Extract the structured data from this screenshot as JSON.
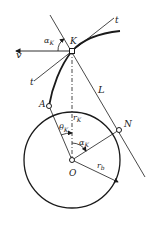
{
  "diagram": {
    "colors": {
      "line": "#1a1a1a",
      "background": "#ffffff"
    },
    "labels": {
      "v": "v",
      "alpha_K_top": "α",
      "alpha_K_top_sub": "K",
      "K": "K",
      "t_top": "t",
      "t_left": "t",
      "L": "L",
      "A": "A",
      "r_K": "r",
      "r_K_sub": "K",
      "N": "N",
      "theta_K": "θ",
      "theta_K_sub": "K",
      "alpha_K_bottom": "α",
      "alpha_K_bottom_sub": "K",
      "O": "O",
      "r_b": "r",
      "r_b_sub": "b"
    },
    "points": {
      "K": [
        72,
        51
      ],
      "O": [
        72,
        160
      ],
      "A": [
        49,
        106
      ],
      "N": [
        119,
        130
      ]
    },
    "base_circle_radius": 48
  }
}
